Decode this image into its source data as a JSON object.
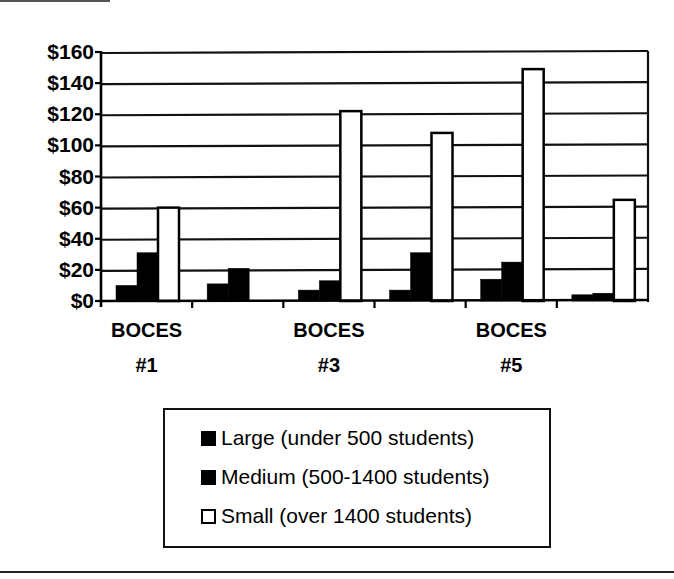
{
  "chart_data": {
    "type": "bar",
    "title": "",
    "xlabel": "",
    "ylabel": "",
    "categories": [
      "BOCES #1",
      "BOCES #2",
      "BOCES #3",
      "BOCES #4",
      "BOCES #5",
      "BOCES #6"
    ],
    "category_tick_labels": [
      {
        "line1": "BOCES",
        "line2": "#1"
      },
      {
        "line1": "",
        "line2": ""
      },
      {
        "line1": "BOCES",
        "line2": "#3"
      },
      {
        "line1": "",
        "line2": ""
      },
      {
        "line1": "BOCES",
        "line2": "#5"
      },
      {
        "line1": "",
        "line2": ""
      }
    ],
    "series": [
      {
        "name": "Large (under 500 students)",
        "color": "#000000",
        "values": [
          10,
          11,
          7,
          7,
          14,
          4
        ]
      },
      {
        "name": "Medium (500-1400 students)",
        "color": "#000000",
        "values": [
          31,
          21,
          13,
          31,
          25,
          5
        ]
      },
      {
        "name": "Small (over 1400 students)",
        "color": "#ffffff",
        "values": [
          60,
          0,
          122,
          108,
          149,
          65
        ]
      }
    ],
    "ylim": [
      0,
      160
    ],
    "yticks": [
      0,
      20,
      40,
      60,
      80,
      100,
      120,
      140,
      160
    ],
    "ytick_labels": [
      "$0",
      "$20",
      "$40",
      "$60",
      "$80",
      "$100",
      "$120",
      "$140",
      "$160"
    ],
    "grid": true,
    "legend_position": "bottom"
  },
  "legend": {
    "items": [
      {
        "label": "Large (under 500 students)",
        "swatch": "dark"
      },
      {
        "label": "Medium (500-1400 students)",
        "swatch": "dark"
      },
      {
        "label": "Small (over 1400 students)",
        "swatch": "light"
      }
    ]
  }
}
